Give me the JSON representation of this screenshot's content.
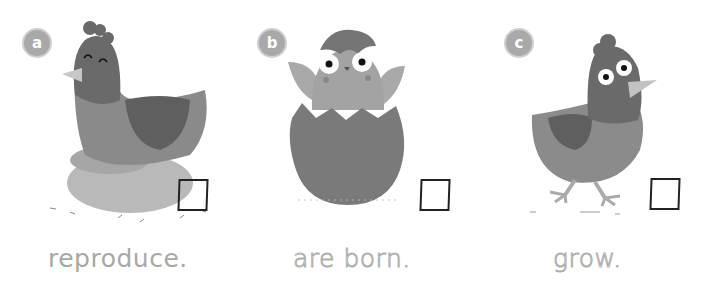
{
  "panels": [
    {
      "letter": "a",
      "caption": "reproduce.",
      "caption_style": "solid",
      "illustration": "hen-sitting-on-nest"
    },
    {
      "letter": "b",
      "caption": "are born.",
      "caption_style": "dotted-trace",
      "illustration": "chick-hatching-from-egg"
    },
    {
      "letter": "c",
      "caption": "grow.",
      "caption_style": "dotted-trace",
      "illustration": "young-chicken-walking"
    }
  ],
  "colors": {
    "badge": "#a9a9a9",
    "body_dark": "#6e6e6e",
    "body_mid": "#8a8a8a",
    "nest": "#b8b8b8",
    "beak": "#c4c4c4",
    "checkbox_border": "#222222",
    "caption": "#a8a8a8"
  }
}
